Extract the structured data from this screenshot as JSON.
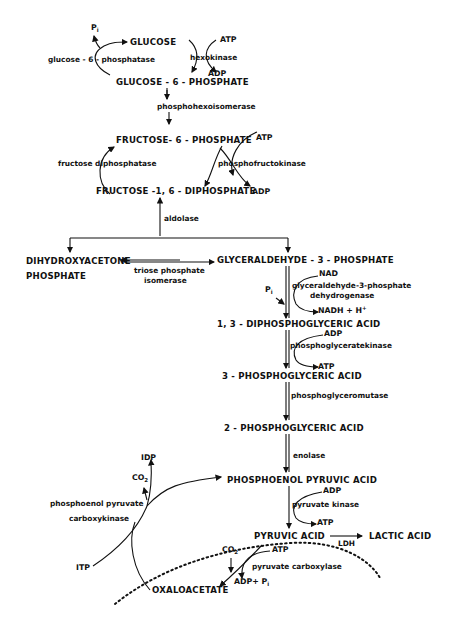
{
  "diagram": {
    "metabolites": {
      "glucose": "GLUCOSE",
      "g6p": "GLUCOSE - 6 - PHOSPHATE",
      "f6p": "FRUCTOSE- 6 - PHOSPHATE",
      "f16bp": "FRUCTOSE -1, 6 - DIPHOSPHATE",
      "dhap_line1": "DIHYDROXYACETONE",
      "dhap_line2": "PHOSPHATE",
      "g3p": "GLYCERALDEHYDE - 3 - PHOSPHATE",
      "bpg13": "1, 3 - DIPHOSPHOGLYCERIC  ACID",
      "pg3": "3 - PHOSPHOGLYCERIC  ACID",
      "pg2": "2 - PHOSPHOGLYCERIC  ACID",
      "pep": "PHOSPHOENOL PYRUVIC  ACID",
      "pyruvate": "PYRUVIC  ACID",
      "lactate": "LACTIC  ACID",
      "oxaloacetate": "OXALOACETATE"
    },
    "enzymes": {
      "g6pase": "glucose - 6 - phosphatase",
      "hexokinase": "hexokinase",
      "phi": "phosphohexoisomerase",
      "fdpase": "fructose  diphosphatase",
      "pfk": "phosphofructokinase",
      "aldolase": "aldolase",
      "tpi_line1": "triose  phosphate",
      "tpi_line2": "isomerase",
      "gapdh_line1": "glyceraldehyde-3-phosphate",
      "gapdh_line2": "dehydrogenase",
      "pgk": "phosphoglyceratekinase",
      "pgm": "phosphoglyceromutase",
      "enolase": "enolase",
      "pk": "pyruvate  kinase",
      "ldh": "LDH",
      "pepck_line1": "phosphoenol pyruvate",
      "pepck_line2": "carboxykinase",
      "pc": "pyruvate  carboxylase"
    },
    "cofactors": {
      "pi_top": "P",
      "pi_sub": "i",
      "hk_atp": "ATP",
      "hk_adp": "ADP",
      "pfk_atp": "ATP",
      "pfk_adp": "ADP",
      "gapdh_pi": "P",
      "gapdh_pi_sub": "i",
      "nad": "NAD",
      "nadh": "NADH + H",
      "nadh_sup": "+",
      "pgk_adp": "ADP",
      "pgk_atp": "ATP",
      "pk_adp": "ADP",
      "pk_atp": "ATP",
      "idp": "IDP",
      "co2_pepck": "CO",
      "co2_pepck_sub": "2",
      "itp": "ITP",
      "co2_pc": "CO",
      "co2_pc_sub": "2",
      "pc_atp": "ATP",
      "pc_adp": "ADP+ P",
      "pc_adp_sub": "i"
    }
  }
}
